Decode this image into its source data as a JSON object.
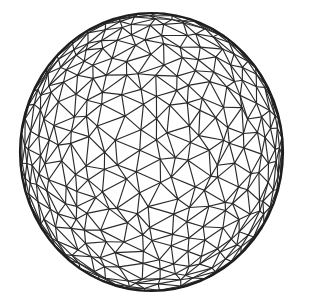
{
  "figure": {
    "background": "#ffffff",
    "line_color": "#2a2a2a",
    "outline_color": "#1e1e1e",
    "center": [
      151.5,
      152
    ],
    "radius_x": 131.5,
    "radius_y": 139,
    "subdivisions": 3,
    "jitter": 0.09,
    "tilt_deg": 18,
    "spin_deg": 25
  }
}
